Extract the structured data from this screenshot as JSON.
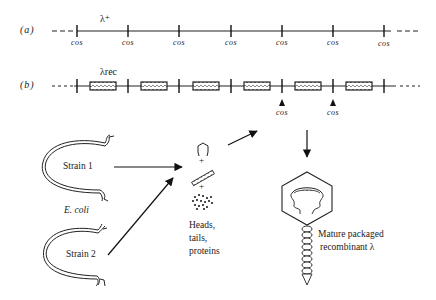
{
  "figure": {
    "row_a": {
      "label": "(a)",
      "title": "λ⁺",
      "cos_labels": [
        "cos",
        "cos",
        "cos",
        "cos",
        "cos",
        "cos",
        "cos"
      ]
    },
    "row_b": {
      "label": "(b)",
      "title": "λrec",
      "cos_labels": [
        "cos",
        "cos"
      ]
    },
    "strains": [
      {
        "label": "Strain 1"
      },
      {
        "label": "Strain 2"
      }
    ],
    "host_label": "E. coli",
    "components": {
      "symbols": [
        "hexagon-head-icon",
        "+",
        "tail-icon",
        "+",
        "proteins-dots-icon"
      ],
      "plus_1": "+",
      "plus_2": "+",
      "caption_lines": [
        "Heads,",
        "tails,",
        "proteins"
      ]
    },
    "product": {
      "caption_lines": [
        "Mature packaged",
        "recombinant λ"
      ]
    }
  }
}
